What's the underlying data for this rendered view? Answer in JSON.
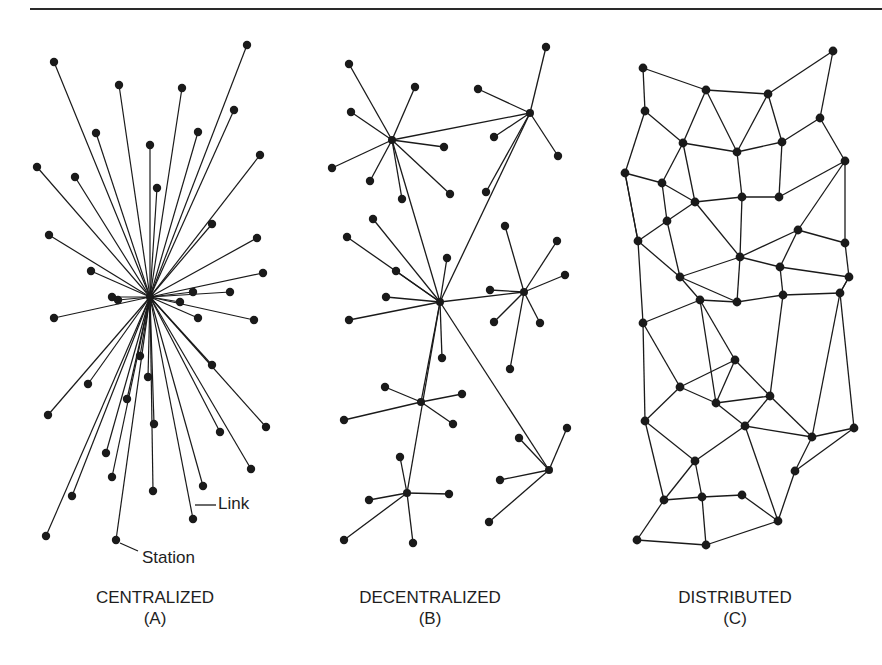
{
  "header": {
    "fragment": ""
  },
  "annotations": {
    "link_label": "Link",
    "station_label": "Station"
  },
  "panels": [
    {
      "id": "A",
      "title": "CENTRALIZED",
      "letter": "(A)"
    },
    {
      "id": "B",
      "title": "DECENTRALIZED",
      "letter": "(B)"
    },
    {
      "id": "C",
      "title": "DISTRIBUTED",
      "letter": "(C)"
    }
  ],
  "colors": {
    "ink": "#1a1a1a",
    "background": "#ffffff"
  },
  "diagrams": {
    "centralized": {
      "hub": [
        150,
        297
      ],
      "stations": [
        [
          54,
          62
        ],
        [
          247,
          45
        ],
        [
          119,
          85
        ],
        [
          182,
          88
        ],
        [
          234,
          110
        ],
        [
          96,
          133
        ],
        [
          260,
          155
        ],
        [
          150,
          145
        ],
        [
          37,
          167
        ],
        [
          75,
          177
        ],
        [
          157,
          188
        ],
        [
          198,
          132
        ],
        [
          212,
          224
        ],
        [
          49,
          235
        ],
        [
          257,
          238
        ],
        [
          91,
          271
        ],
        [
          263,
          273
        ],
        [
          112,
          297
        ],
        [
          193,
          292
        ],
        [
          230,
          292
        ],
        [
          54,
          318
        ],
        [
          198,
          318
        ],
        [
          254,
          320
        ],
        [
          140,
          356
        ],
        [
          212,
          365
        ],
        [
          88,
          384
        ],
        [
          127,
          399
        ],
        [
          154,
          424
        ],
        [
          48,
          415
        ],
        [
          220,
          432
        ],
        [
          266,
          427
        ],
        [
          106,
          453
        ],
        [
          251,
          469
        ],
        [
          203,
          486
        ],
        [
          153,
          491
        ],
        [
          72,
          496
        ],
        [
          112,
          477
        ],
        [
          46,
          536
        ],
        [
          193,
          519
        ],
        [
          116,
          540
        ],
        [
          118,
          300
        ],
        [
          180,
          302
        ],
        [
          148,
          377
        ]
      ]
    },
    "decentralized": {
      "hubs": [
        [
          392,
          140
        ],
        [
          530,
          113
        ],
        [
          440,
          302
        ],
        [
          524,
          292
        ],
        [
          421,
          402
        ],
        [
          407,
          493
        ],
        [
          549,
          470
        ]
      ],
      "hub_links": [
        [
          0,
          1
        ],
        [
          0,
          2
        ],
        [
          1,
          2
        ],
        [
          2,
          3
        ],
        [
          2,
          4
        ],
        [
          2,
          5
        ],
        [
          2,
          6
        ]
      ],
      "spokes": [
        [
          0,
          [
            349,
            64
          ]
        ],
        [
          0,
          [
            415,
            87
          ]
        ],
        [
          0,
          [
            351,
            112
          ]
        ],
        [
          0,
          [
            444,
            147
          ]
        ],
        [
          0,
          [
            332,
            168
          ]
        ],
        [
          0,
          [
            370,
            181
          ]
        ],
        [
          0,
          [
            402,
            199
          ]
        ],
        [
          0,
          [
            450,
            194
          ]
        ],
        [
          1,
          [
            546,
            47
          ]
        ],
        [
          1,
          [
            478,
            89
          ]
        ],
        [
          1,
          [
            494,
            137
          ]
        ],
        [
          1,
          [
            558,
            156
          ]
        ],
        [
          1,
          [
            486,
            192
          ]
        ],
        [
          2,
          [
            373,
            219
          ]
        ],
        [
          2,
          [
            347,
            237
          ]
        ],
        [
          2,
          [
            396,
            271
          ]
        ],
        [
          2,
          [
            386,
            297
          ]
        ],
        [
          2,
          [
            349,
            320
          ]
        ],
        [
          2,
          [
            447,
            258
          ]
        ],
        [
          2,
          [
            442,
            358
          ]
        ],
        [
          3,
          [
            505,
            226
          ]
        ],
        [
          3,
          [
            557,
            241
          ]
        ],
        [
          3,
          [
            565,
            275
          ]
        ],
        [
          3,
          [
            490,
            290
          ]
        ],
        [
          3,
          [
            494,
            322
          ]
        ],
        [
          3,
          [
            540,
            323
          ]
        ],
        [
          3,
          [
            510,
            369
          ]
        ],
        [
          4,
          [
            385,
            387
          ]
        ],
        [
          4,
          [
            462,
            394
          ]
        ],
        [
          4,
          [
            344,
            420
          ]
        ],
        [
          4,
          [
            453,
            424
          ]
        ],
        [
          5,
          [
            400,
            457
          ]
        ],
        [
          5,
          [
            369,
            500
          ]
        ],
        [
          5,
          [
            449,
            494
          ]
        ],
        [
          5,
          [
            344,
            540
          ]
        ],
        [
          5,
          [
            413,
            543
          ]
        ],
        [
          6,
          [
            519,
            438
          ]
        ],
        [
          6,
          [
            567,
            428
          ]
        ],
        [
          6,
          [
            500,
            480
          ]
        ],
        [
          6,
          [
            489,
            522
          ]
        ]
      ]
    },
    "distributed": {
      "nodes": [
        [
          643,
          68
        ],
        [
          706,
          90
        ],
        [
          768,
          94
        ],
        [
          833,
          51
        ],
        [
          645,
          111
        ],
        [
          820,
          118
        ],
        [
          683,
          143
        ],
        [
          737,
          152
        ],
        [
          782,
          142
        ],
        [
          625,
          173
        ],
        [
          662,
          183
        ],
        [
          845,
          161
        ],
        [
          695,
          202
        ],
        [
          742,
          197
        ],
        [
          779,
          197
        ],
        [
          667,
          221
        ],
        [
          638,
          241
        ],
        [
          798,
          230
        ],
        [
          740,
          257
        ],
        [
          845,
          243
        ],
        [
          680,
          277
        ],
        [
          780,
          267
        ],
        [
          849,
          277
        ],
        [
          643,
          323
        ],
        [
          700,
          300
        ],
        [
          737,
          302
        ],
        [
          783,
          295
        ],
        [
          840,
          293
        ],
        [
          735,
          360
        ],
        [
          680,
          387
        ],
        [
          770,
          396
        ],
        [
          716,
          403
        ],
        [
          645,
          421
        ],
        [
          745,
          426
        ],
        [
          812,
          437
        ],
        [
          854,
          428
        ],
        [
          695,
          461
        ],
        [
          795,
          471
        ],
        [
          664,
          500
        ],
        [
          702,
          497
        ],
        [
          742,
          495
        ],
        [
          778,
          521
        ],
        [
          637,
          540
        ],
        [
          706,
          545
        ]
      ],
      "edges": [
        [
          0,
          1
        ],
        [
          0,
          4
        ],
        [
          1,
          2
        ],
        [
          2,
          3
        ],
        [
          3,
          5
        ],
        [
          1,
          6
        ],
        [
          1,
          7
        ],
        [
          2,
          7
        ],
        [
          2,
          8
        ],
        [
          4,
          6
        ],
        [
          4,
          9
        ],
        [
          5,
          8
        ],
        [
          5,
          11
        ],
        [
          6,
          7
        ],
        [
          7,
          8
        ],
        [
          6,
          10
        ],
        [
          6,
          12
        ],
        [
          9,
          10
        ],
        [
          9,
          16
        ],
        [
          10,
          12
        ],
        [
          10,
          15
        ],
        [
          12,
          13
        ],
        [
          13,
          14
        ],
        [
          13,
          7
        ],
        [
          14,
          8
        ],
        [
          14,
          11
        ],
        [
          11,
          17
        ],
        [
          11,
          19
        ],
        [
          12,
          18
        ],
        [
          15,
          12
        ],
        [
          15,
          16
        ],
        [
          15,
          20
        ],
        [
          16,
          20
        ],
        [
          16,
          23
        ],
        [
          17,
          18
        ],
        [
          17,
          21
        ],
        [
          17,
          19
        ],
        [
          18,
          13
        ],
        [
          18,
          21
        ],
        [
          18,
          20
        ],
        [
          19,
          22
        ],
        [
          21,
          22
        ],
        [
          20,
          24
        ],
        [
          21,
          26
        ],
        [
          22,
          27
        ],
        [
          23,
          24
        ],
        [
          23,
          29
        ],
        [
          23,
          32
        ],
        [
          24,
          25
        ],
        [
          24,
          28
        ],
        [
          25,
          26
        ],
        [
          25,
          18
        ],
        [
          26,
          27
        ],
        [
          26,
          30
        ],
        [
          27,
          22
        ],
        [
          27,
          34
        ],
        [
          28,
          29
        ],
        [
          28,
          30
        ],
        [
          28,
          31
        ],
        [
          29,
          31
        ],
        [
          29,
          32
        ],
        [
          30,
          31
        ],
        [
          30,
          33
        ],
        [
          30,
          34
        ],
        [
          31,
          33
        ],
        [
          32,
          36
        ],
        [
          32,
          38
        ],
        [
          33,
          34
        ],
        [
          33,
          36
        ],
        [
          34,
          35
        ],
        [
          34,
          37
        ],
        [
          35,
          27
        ],
        [
          35,
          37
        ],
        [
          36,
          38
        ],
        [
          36,
          39
        ],
        [
          37,
          41
        ],
        [
          38,
          39
        ],
        [
          38,
          42
        ],
        [
          39,
          40
        ],
        [
          39,
          43
        ],
        [
          40,
          41
        ],
        [
          41,
          33
        ],
        [
          42,
          43
        ],
        [
          43,
          41
        ],
        [
          20,
          25
        ],
        [
          24,
          31
        ],
        [
          9,
          16
        ]
      ]
    }
  }
}
